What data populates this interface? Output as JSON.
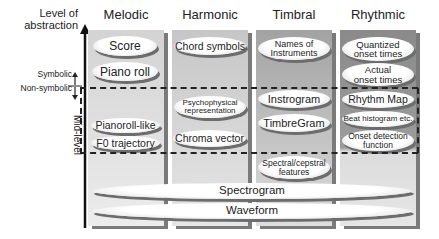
{
  "axis": {
    "title_line1": "Level of",
    "title_line2": "abstraction",
    "symbolic_label": "Symbolic",
    "non_symbolic_label": "Non-symbolic",
    "mid_level_label": "Mid-level"
  },
  "columns": [
    {
      "title": "Melodic",
      "items": [
        "Score",
        "Piano roll",
        "Pianoroll-like",
        "F0 trajectory"
      ]
    },
    {
      "title": "Harmonic",
      "items": [
        "Chord symbols",
        "Psychophysical representation",
        "Chroma vector"
      ]
    },
    {
      "title": "Timbral",
      "items": [
        "Names of Instruments",
        "Instrogram",
        "TimbreGram",
        "Spectral/cepstral features"
      ]
    },
    {
      "title": "Rhythmic",
      "items": [
        "Quantized onset times",
        "Actual onset times",
        "Rhythm Map",
        "Beat histogram etc.",
        "Onset detection function"
      ]
    }
  ],
  "shared": {
    "spectrogram": "Spectrogram",
    "waveform": "Waveform"
  },
  "text": {
    "names_of_l1": "Names of",
    "names_of_l2": "Instruments",
    "quantized_l1": "Quantized",
    "quantized_l2": "onset times",
    "actual_l1": "Actual",
    "actual_l2": "onset times",
    "psycho_l1": "Psychophysical",
    "psycho_l2": "representation",
    "spectral_l1": "Spectral/cepstral",
    "spectral_l2": "features",
    "onset_l1": "Onset detection",
    "onset_l2": "function"
  },
  "colors": {
    "melodic_bg": "#d9d9d9",
    "harmonic_bg": "#cfcfcf",
    "timbral_bg": "#b3b3b3",
    "rhythmic_bg": "#9a9a9a",
    "line": "#222222"
  }
}
